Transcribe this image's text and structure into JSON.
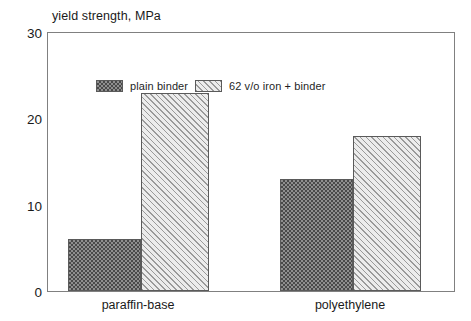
{
  "chart_data": {
    "type": "bar",
    "title": "yield strength, MPa",
    "xlabel": "",
    "ylabel": "yield strength, MPa",
    "categories": [
      "paraffin-base",
      "polyethylene"
    ],
    "series": [
      {
        "name": "plain binder",
        "values": [
          6,
          13
        ],
        "pattern": "checkerboard",
        "color": "#8f8f8f"
      },
      {
        "name": "62 v/o iron + binder",
        "values": [
          23,
          18
        ],
        "pattern": "diagonal-hatch",
        "color": "#e8e8e8"
      }
    ],
    "ylim": [
      0,
      30
    ],
    "yticks": [
      0,
      10,
      20,
      30
    ],
    "ytick_labels": [
      "0",
      "10",
      "20",
      "30"
    ],
    "grid": false,
    "legend_position": "top-left-inside",
    "frame": true
  },
  "axis": {
    "y_labels": [
      "30",
      "20",
      "10",
      "0"
    ],
    "x_labels": [
      "paraffin-base",
      "polyethylene"
    ]
  },
  "legend": {
    "items": [
      {
        "label": "plain binder"
      },
      {
        "label": "62 v/o iron + binder"
      }
    ]
  }
}
